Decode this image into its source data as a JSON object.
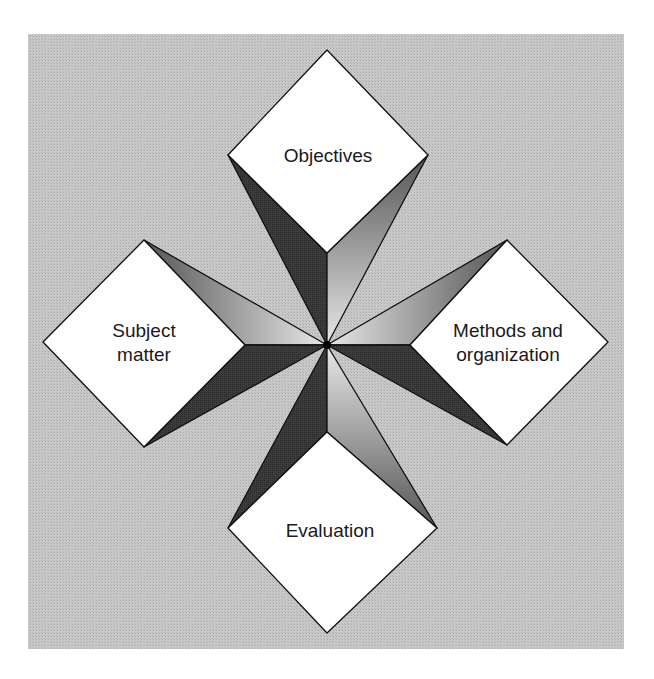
{
  "diagram": {
    "type": "four-element curriculum model (star diagram)",
    "center": {
      "x": 327,
      "y": 345
    },
    "nodes": [
      {
        "id": "objectives",
        "label_lines": [
          "Objectives"
        ],
        "position": "top"
      },
      {
        "id": "subject_matter",
        "label_lines": [
          "Subject",
          "matter"
        ],
        "position": "left"
      },
      {
        "id": "methods",
        "label_lines": [
          "Methods and",
          "organization"
        ],
        "position": "right"
      },
      {
        "id": "evaluation",
        "label_lines": [
          "Evaluation"
        ],
        "position": "bottom"
      }
    ],
    "labels": {
      "objectives": "Objectives",
      "subject_matter_1": "Subject",
      "subject_matter_2": "matter",
      "methods_1": "Methods and",
      "methods_2": "organization",
      "evaluation": "Evaluation"
    },
    "colors": {
      "background": "#c4c4c4",
      "node_fill": "#ffffff",
      "stroke": "#111111",
      "dark_face": "#3a3a3a",
      "light_face_start": "#5a5a5a",
      "light_face_end": "#e6e6e6"
    }
  }
}
